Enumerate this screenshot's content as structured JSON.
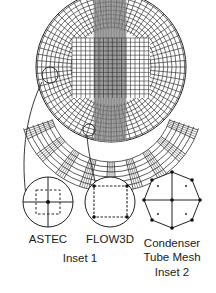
{
  "figure": {
    "type": "mesh-diagram",
    "colors": {
      "line": "#2a2a2a",
      "shade": "#9a9a9a",
      "background": "#ffffff"
    },
    "insets": [
      {
        "id": "inset1",
        "caption": "Inset 1",
        "panels": [
          {
            "label": "ASTEC",
            "shape": "circle",
            "detail": "cross with dashed square control volume, node at center"
          },
          {
            "label": "FLOW3D",
            "shape": "circle",
            "detail": "dashed square with nodes at corners"
          }
        ]
      },
      {
        "id": "inset2",
        "caption": "Inset 2",
        "panels": [
          {
            "label": "Condenser Tube Mesh",
            "label_lines": [
              "Condenser",
              "Tube Mesh"
            ],
            "shape": "octagon",
            "detail": "octagon with vertex nodes, cross through center, four interior points"
          }
        ]
      }
    ]
  }
}
